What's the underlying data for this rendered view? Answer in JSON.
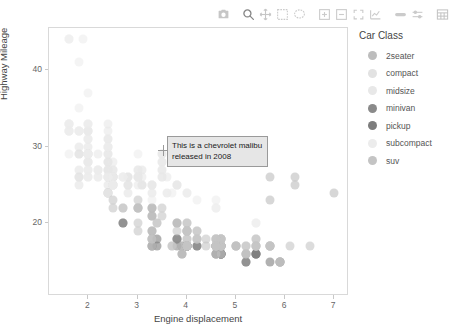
{
  "modebar": {
    "buttons": [
      {
        "name": "camera-icon",
        "label": "Download plot as a png",
        "active": false
      },
      {
        "name": "zoom-icon",
        "label": "Zoom",
        "active": true
      },
      {
        "name": "pan-icon",
        "label": "Pan",
        "active": false
      },
      {
        "name": "box-select-icon",
        "label": "Box Select",
        "active": false
      },
      {
        "name": "lasso-select-icon",
        "label": "Lasso Select",
        "active": false
      },
      {
        "name": "zoom-in-icon",
        "label": "Zoom in",
        "active": false
      },
      {
        "name": "zoom-out-icon",
        "label": "Zoom out",
        "active": false
      },
      {
        "name": "autoscale-icon",
        "label": "Autoscale",
        "active": false
      },
      {
        "name": "reset-axes-icon",
        "label": "Reset axes",
        "active": false
      },
      {
        "name": "spike-lines-icon",
        "label": "Toggle Spike Lines",
        "active": false
      },
      {
        "name": "hover-compare-icon",
        "label": "Compare data on hover",
        "active": false
      },
      {
        "name": "table-icon",
        "label": "Show data table",
        "active": false
      }
    ]
  },
  "tooltip": {
    "line1": "This is a chevrolet malibu",
    "line2": "released in 2008"
  },
  "legend": {
    "title": "Car Class",
    "items": [
      {
        "label": "2seater",
        "color": "#bdbdbd"
      },
      {
        "label": "compact",
        "color": "#e2e2e2"
      },
      {
        "label": "midsize",
        "color": "#e8e8e8"
      },
      {
        "label": "minivan",
        "color": "#8a8a8a"
      },
      {
        "label": "pickup",
        "color": "#7d7d7d"
      },
      {
        "label": "subcompact",
        "color": "#ececec"
      },
      {
        "label": "suv",
        "color": "#c4c4c4"
      }
    ]
  },
  "chart_data": {
    "type": "scatter",
    "title": "",
    "xlabel": "Engine displacement",
    "ylabel": "Highway Mileage",
    "xlim": [
      1.2,
      7.3
    ],
    "ylim": [
      10.5,
      45.5
    ],
    "xticks": [
      2,
      3,
      4,
      5,
      6,
      7
    ],
    "yticks": [
      20,
      30,
      40
    ],
    "grid": false,
    "legend_position": "right",
    "marker_size": 9,
    "marker_opacity": 0.6,
    "series": [
      {
        "name": "2seater",
        "color": "#bdbdbd",
        "points": [
          [
            5.7,
            26
          ],
          [
            5.7,
            23
          ],
          [
            6.2,
            26
          ],
          [
            6.2,
            25
          ],
          [
            7.0,
            24
          ]
        ]
      },
      {
        "name": "compact",
        "color": "#e2e2e2",
        "points": [
          [
            1.8,
            29
          ],
          [
            1.8,
            29
          ],
          [
            2.0,
            31
          ],
          [
            2.0,
            30
          ],
          [
            2.8,
            26
          ],
          [
            2.8,
            26
          ],
          [
            3.1,
            27
          ],
          [
            1.8,
            26
          ],
          [
            1.8,
            25
          ],
          [
            2.0,
            28
          ],
          [
            2.0,
            27
          ],
          [
            2.8,
            25
          ],
          [
            2.8,
            25
          ],
          [
            3.1,
            25
          ],
          [
            3.1,
            25
          ],
          [
            2.4,
            27
          ],
          [
            2.4,
            25
          ],
          [
            2.5,
            27
          ],
          [
            2.5,
            25
          ],
          [
            3.3,
            24
          ],
          [
            2.0,
            29
          ],
          [
            2.0,
            29
          ],
          [
            2.4,
            29
          ],
          [
            2.4,
            28
          ],
          [
            2.0,
            28
          ],
          [
            2.0,
            29
          ],
          [
            2.4,
            26
          ],
          [
            2.4,
            27
          ],
          [
            2.5,
            26
          ],
          [
            2.5,
            26
          ],
          [
            1.6,
            33
          ],
          [
            1.6,
            32
          ],
          [
            1.8,
            32
          ],
          [
            1.8,
            30
          ],
          [
            2.0,
            32
          ],
          [
            2.4,
            28
          ],
          [
            2.0,
            33
          ],
          [
            2.0,
            32
          ],
          [
            2.8,
            24
          ],
          [
            3.6,
            24
          ],
          [
            2.5,
            26
          ],
          [
            2.5,
            25
          ],
          [
            2.5,
            26
          ],
          [
            2.5,
            25
          ],
          [
            2.5,
            26
          ],
          [
            1.8,
            26
          ],
          [
            1.8,
            27
          ],
          [
            2.0,
            26
          ]
        ]
      },
      {
        "name": "midsize",
        "color": "#e8e8e8",
        "points": [
          [
            2.4,
            31
          ],
          [
            2.4,
            30
          ],
          [
            3.1,
            26
          ],
          [
            3.5,
            29
          ],
          [
            3.6,
            26
          ],
          [
            2.4,
            27
          ],
          [
            3.0,
            26
          ],
          [
            3.3,
            25
          ],
          [
            3.3,
            25
          ],
          [
            3.5,
            28
          ],
          [
            3.5,
            27
          ],
          [
            3.8,
            25
          ],
          [
            3.8,
            25
          ],
          [
            3.8,
            25
          ],
          [
            4.0,
            24
          ],
          [
            2.4,
            32
          ],
          [
            2.4,
            31
          ],
          [
            2.4,
            29
          ],
          [
            3.0,
            27
          ],
          [
            3.0,
            26
          ],
          [
            3.5,
            29
          ],
          [
            3.5,
            28
          ],
          [
            2.4,
            33
          ],
          [
            2.4,
            30
          ],
          [
            2.5,
            27
          ],
          [
            2.5,
            28
          ],
          [
            3.5,
            27
          ],
          [
            3.5,
            26
          ],
          [
            3.0,
            26
          ],
          [
            3.0,
            25
          ],
          [
            3.3,
            25
          ],
          [
            2.2,
            29
          ],
          [
            2.2,
            27
          ],
          [
            2.4,
            26
          ],
          [
            2.4,
            26
          ],
          [
            3.0,
            27
          ],
          [
            3.0,
            26
          ],
          [
            3.5,
            26
          ],
          [
            2.2,
            26
          ],
          [
            2.2,
            27
          ],
          [
            2.4,
            26
          ]
        ]
      },
      {
        "name": "minivan",
        "color": "#8a8a8a",
        "points": [
          [
            2.4,
            24
          ],
          [
            3.0,
            22
          ],
          [
            3.3,
            21
          ],
          [
            3.3,
            22
          ],
          [
            3.8,
            20
          ],
          [
            3.8,
            18
          ],
          [
            3.8,
            18
          ],
          [
            4.0,
            17
          ],
          [
            3.3,
            17
          ],
          [
            3.3,
            18
          ],
          [
            3.8,
            17
          ],
          [
            3.8,
            18
          ],
          [
            3.3,
            19
          ],
          [
            3.3,
            17
          ]
        ]
      },
      {
        "name": "pickup",
        "color": "#7d7d7d",
        "points": [
          [
            2.7,
            20
          ],
          [
            2.7,
            20
          ],
          [
            3.4,
            18
          ],
          [
            3.4,
            17
          ],
          [
            4.0,
            17
          ],
          [
            4.0,
            17
          ],
          [
            4.7,
            16
          ],
          [
            4.7,
            17
          ],
          [
            4.7,
            17
          ],
          [
            5.7,
            17
          ],
          [
            5.9,
            15
          ],
          [
            4.7,
            16
          ],
          [
            4.7,
            16
          ],
          [
            4.7,
            16
          ],
          [
            5.2,
            16
          ],
          [
            5.2,
            15
          ],
          [
            3.9,
            16
          ],
          [
            3.9,
            17
          ],
          [
            4.7,
            17
          ],
          [
            4.7,
            16
          ],
          [
            4.7,
            16
          ],
          [
            5.2,
            15
          ],
          [
            5.7,
            15
          ],
          [
            5.9,
            15
          ],
          [
            4.6,
            17
          ],
          [
            5.4,
            16
          ],
          [
            5.4,
            16
          ],
          [
            4.0,
            17
          ],
          [
            4.0,
            17
          ],
          [
            4.0,
            17
          ],
          [
            4.6,
            16
          ],
          [
            5.0,
            17
          ],
          [
            4.2,
            17
          ],
          [
            4.2,
            17
          ],
          [
            4.6,
            16
          ],
          [
            4.6,
            17
          ],
          [
            4.6,
            17
          ],
          [
            5.4,
            16
          ],
          [
            5.4,
            16
          ]
        ]
      },
      {
        "name": "subcompact",
        "color": "#ececec",
        "points": [
          [
            1.6,
            33
          ],
          [
            1.6,
            33
          ],
          [
            1.6,
            32
          ],
          [
            1.6,
            32
          ],
          [
            1.6,
            29
          ],
          [
            1.8,
            32
          ],
          [
            1.8,
            32
          ],
          [
            2.0,
            28
          ],
          [
            2.4,
            24
          ],
          [
            2.4,
            24
          ],
          [
            2.5,
            26
          ],
          [
            2.5,
            25
          ],
          [
            3.3,
            23
          ],
          [
            2.0,
            29
          ],
          [
            2.0,
            27
          ],
          [
            2.0,
            31
          ],
          [
            2.0,
            32
          ],
          [
            2.7,
            26
          ],
          [
            2.7,
            26
          ],
          [
            2.7,
            26
          ],
          [
            3.0,
            29
          ],
          [
            3.7,
            24
          ],
          [
            4.0,
            24
          ],
          [
            4.2,
            23
          ],
          [
            4.6,
            22
          ],
          [
            4.6,
            22
          ],
          [
            4.6,
            23
          ],
          [
            5.4,
            20
          ],
          [
            5.4,
            17
          ],
          [
            1.6,
            44
          ],
          [
            1.6,
            44
          ],
          [
            1.8,
            41
          ],
          [
            1.8,
            35
          ],
          [
            2.0,
            33
          ],
          [
            2.0,
            37
          ],
          [
            2.4,
            30
          ],
          [
            2.4,
            26
          ],
          [
            2.5,
            25
          ],
          [
            5.4,
            20
          ],
          [
            2.2,
            26
          ],
          [
            2.2,
            27
          ],
          [
            1.9,
            44
          ],
          [
            2.0,
            29
          ],
          [
            2.0,
            26
          ],
          [
            2.0,
            29
          ]
        ]
      },
      {
        "name": "suv",
        "color": "#c4c4c4",
        "points": [
          [
            3.0,
            20
          ],
          [
            3.0,
            19
          ],
          [
            3.7,
            17
          ],
          [
            3.7,
            17
          ],
          [
            3.9,
            17
          ],
          [
            3.9,
            16
          ],
          [
            4.7,
            17
          ],
          [
            4.7,
            17
          ],
          [
            4.7,
            18
          ],
          [
            5.2,
            17
          ],
          [
            5.2,
            17
          ],
          [
            5.7,
            17
          ],
          [
            5.9,
            15
          ],
          [
            4.7,
            16
          ],
          [
            4.7,
            17
          ],
          [
            4.7,
            17
          ],
          [
            5.2,
            16
          ],
          [
            5.2,
            16
          ],
          [
            5.7,
            17
          ],
          [
            5.9,
            15
          ],
          [
            4.0,
            17
          ],
          [
            4.0,
            18
          ],
          [
            4.0,
            17
          ],
          [
            4.0,
            18
          ],
          [
            4.6,
            17
          ],
          [
            4.6,
            17
          ],
          [
            5.0,
            17
          ],
          [
            3.3,
            19
          ],
          [
            3.3,
            18
          ],
          [
            4.0,
            17
          ],
          [
            4.0,
            17
          ],
          [
            4.6,
            17
          ],
          [
            4.6,
            17
          ],
          [
            4.7,
            17
          ],
          [
            5.4,
            18
          ],
          [
            3.3,
            17
          ],
          [
            3.3,
            18
          ],
          [
            4.0,
            17
          ],
          [
            4.0,
            17
          ],
          [
            4.6,
            16
          ],
          [
            4.7,
            17
          ],
          [
            5.4,
            17
          ],
          [
            4.2,
            18
          ],
          [
            4.2,
            18
          ],
          [
            4.4,
            17
          ],
          [
            4.6,
            17
          ],
          [
            5.4,
            17
          ],
          [
            5.4,
            17
          ],
          [
            6.5,
            17
          ],
          [
            2.5,
            23
          ],
          [
            2.5,
            22
          ],
          [
            3.0,
            22
          ],
          [
            3.0,
            22
          ],
          [
            3.5,
            22
          ],
          [
            3.5,
            21
          ],
          [
            4.0,
            20
          ],
          [
            4.0,
            20
          ],
          [
            4.2,
            19
          ],
          [
            4.4,
            18
          ],
          [
            4.6,
            18
          ],
          [
            3.0,
            23
          ],
          [
            3.3,
            22
          ],
          [
            3.3,
            21
          ],
          [
            3.8,
            20
          ],
          [
            3.8,
            19
          ],
          [
            4.0,
            19
          ],
          [
            4.0,
            19
          ],
          [
            4.7,
            18
          ],
          [
            4.7,
            18
          ],
          [
            2.7,
            22
          ],
          [
            2.7,
            22
          ],
          [
            3.4,
            20
          ],
          [
            3.4,
            20
          ],
          [
            4.0,
            19
          ],
          [
            4.0,
            19
          ],
          [
            4.7,
            18
          ],
          [
            4.7,
            18
          ],
          [
            4.7,
            18
          ],
          [
            5.7,
            17
          ],
          [
            6.1,
            17
          ],
          [
            4.0,
            19
          ],
          [
            4.0,
            19
          ],
          [
            4.6,
            18
          ],
          [
            5.0,
            17
          ],
          [
            4.2,
            19
          ],
          [
            4.2,
            18
          ],
          [
            4.6,
            18
          ],
          [
            4.6,
            18
          ],
          [
            4.6,
            17
          ],
          [
            5.4,
            17
          ],
          [
            5.4,
            18
          ]
        ]
      }
    ]
  }
}
